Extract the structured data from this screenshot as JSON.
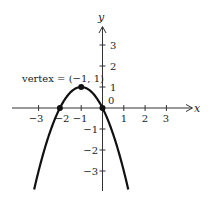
{
  "chart_data": {
    "type": "line",
    "title": "",
    "function": "y = -(x + 1)^2 + 1",
    "xlabel": "x",
    "ylabel": "y",
    "xlim": [
      -3.9,
      4.2
    ],
    "ylim": [
      -3.9,
      3.9
    ],
    "grid": false,
    "x_ticks": [
      -3,
      -2,
      -1,
      1,
      2,
      3
    ],
    "y_ticks": [
      -3,
      -2,
      -1,
      1,
      2,
      3
    ],
    "x_tick_labels": [
      "−3",
      "−2",
      "−1",
      "1",
      "2",
      "3"
    ],
    "y_tick_labels": [
      "−3",
      "−2",
      "−1",
      "1",
      "2",
      "3"
    ],
    "origin_label": "0",
    "series": [
      {
        "name": "parabola",
        "x": [
          -3.2,
          -3,
          -2.5,
          -2,
          -1.5,
          -1,
          -0.5,
          0,
          0.5,
          1,
          1.2
        ],
        "y": [
          -3.84,
          -3,
          -1.25,
          0,
          0.75,
          1,
          0.75,
          0,
          -1.25,
          -3,
          -3.84
        ]
      }
    ],
    "points": [
      {
        "name": "vertex",
        "x": -1,
        "y": 1
      },
      {
        "name": "x-intercept-left",
        "x": -2,
        "y": 0
      },
      {
        "name": "x-intercept-origin",
        "x": 0,
        "y": 0
      }
    ],
    "annotations": [
      {
        "text": "vertex = (−1, 1)",
        "x": -1,
        "y": 1
      }
    ]
  },
  "labels": {
    "x_axis": "x",
    "y_axis": "y",
    "origin": "0",
    "vertex_annotation": "vertex = (−1, 1)",
    "x_ticks": [
      "−3",
      "−2",
      "−1",
      "1",
      "2",
      "3"
    ],
    "y_ticks_pos": [
      "1",
      "2",
      "3"
    ],
    "y_ticks_neg": [
      "−1",
      "−2",
      "−3"
    ]
  },
  "colors": {
    "curve": "#111111",
    "axis": "#333333",
    "background": "#ffffff"
  }
}
